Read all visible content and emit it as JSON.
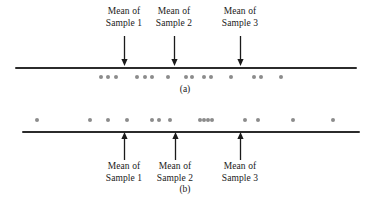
{
  "figure": {
    "width": 370,
    "height": 202,
    "background": "#ffffff",
    "line_color": "#2b2b2b",
    "dot_color": "#8c8c8c",
    "arrow_color": "#1a1a1a",
    "text_color": "#1a1a1a"
  },
  "chart_data": {
    "type": "scatter",
    "title": "",
    "xlabel": "",
    "ylabel": "",
    "grid": false,
    "legend": null,
    "panels": [
      {
        "id": "a",
        "caption": "(a)",
        "axis": {
          "x_start_px": 15,
          "x_end_px": 357,
          "y_px": 67
        },
        "dots_y_px": 77,
        "dots_px": [
          101,
          108,
          116,
          137,
          145,
          152,
          168,
          186,
          192,
          204,
          211,
          231,
          254,
          261,
          281
        ],
        "means": [
          {
            "label_line1": "Mean of",
            "label_line2": "Sample 1",
            "x_px": 124
          },
          {
            "label_line1": "Mean of",
            "label_line2": "Sample 2",
            "x_px": 174
          },
          {
            "label_line1": "Mean of",
            "label_line2": "Sample 3",
            "x_px": 240
          }
        ],
        "arrow_top_px": 36,
        "arrow_bottom_px": 66,
        "label_top_px": 6
      },
      {
        "id": "b",
        "caption": "(b)",
        "axis": {
          "x_start_px": 22,
          "x_end_px": 360,
          "y_px": 131
        },
        "dots_y_px": 120,
        "dots_px": [
          37,
          90,
          108,
          127,
          152,
          159,
          170,
          200,
          204,
          208,
          212,
          245,
          258,
          293,
          333
        ],
        "means": [
          {
            "label_line1": "Mean of",
            "label_line2": "Sample 1",
            "x_px": 124
          },
          {
            "label_line1": "Mean of",
            "label_line2": "Sample 2",
            "x_px": 175
          },
          {
            "label_line1": "Mean of",
            "label_line2": "Sample 3",
            "x_px": 240
          }
        ],
        "arrow_top_px": 132,
        "arrow_bottom_px": 160,
        "label_top_px": 161
      }
    ]
  }
}
